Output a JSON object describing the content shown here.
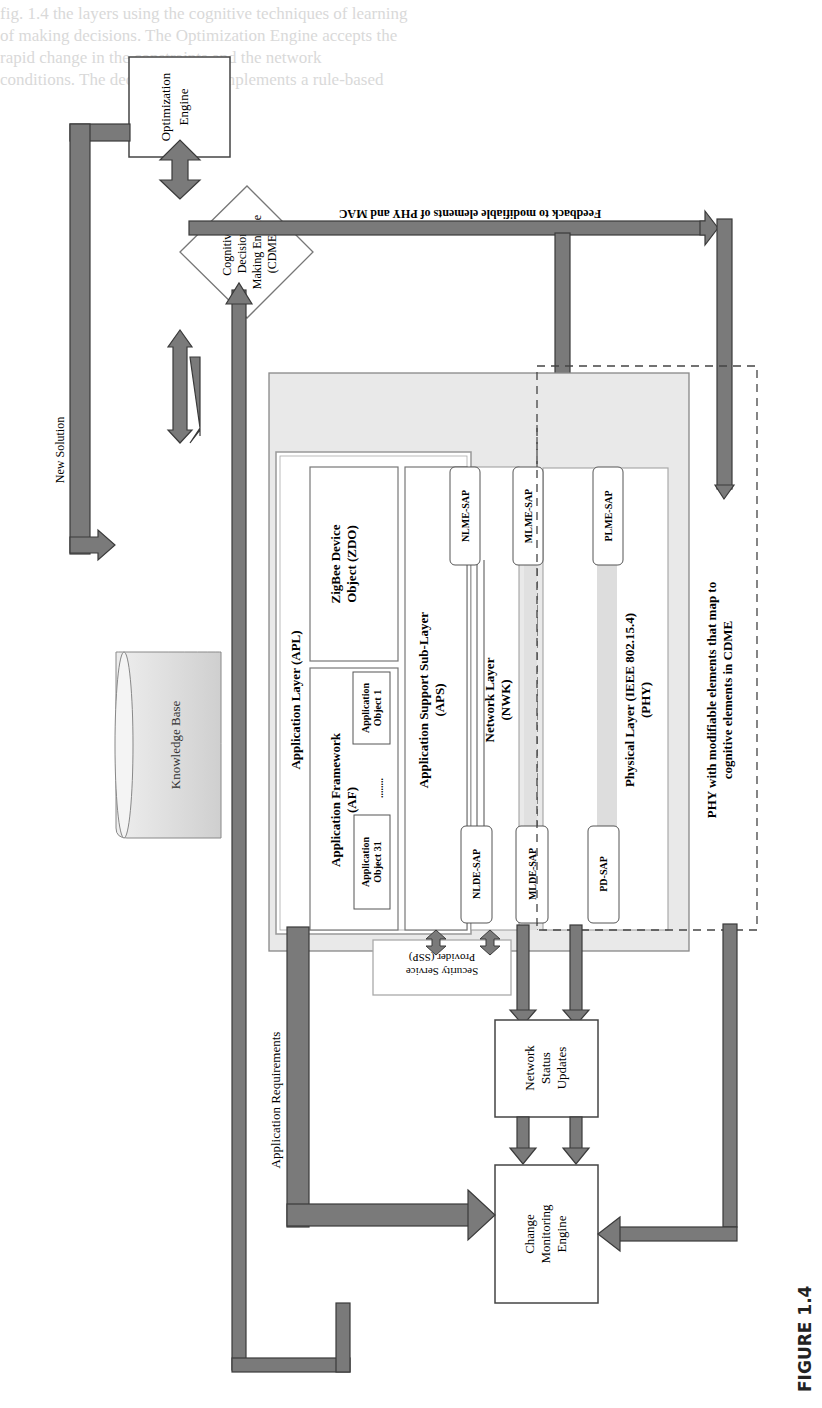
{
  "figure": {
    "caption": "FIGURE 1.4",
    "orientation": "rotated 90° counter-clockwise (landscape figure on portrait page)"
  },
  "colors": {
    "arrow_fill": "#7a7a7a",
    "arrow_stroke": "#3a3a3a",
    "stack_fill": "#e8e8e8",
    "kb_fill": "#d8d8d8",
    "box_border": "#555555",
    "background": "#ffffff"
  },
  "nodes": {
    "optimization_engine": "Optimization Engine",
    "cdme": [
      "Cognitive",
      "Decision",
      "Making Engine",
      "(CDME)"
    ],
    "knowledge_base": "Knowledge Base",
    "network_status_updates": [
      "Network",
      "Status",
      "Updates"
    ],
    "change_monitoring_engine": [
      "Change",
      "Monitoring",
      "Engine"
    ],
    "ssp": [
      "Security Service",
      "Provider (SSP)"
    ],
    "phy_modifiable": [
      "PHY with modifiable elements that map to",
      "cognitive elements in CDME"
    ]
  },
  "stack": {
    "title": [
      "IEEE 802.15.4/ZigBee",
      "Stack"
    ],
    "apl": "Application Layer (APL)",
    "af": [
      "Application Framework",
      "(AF)"
    ],
    "app_object_1": [
      "Application",
      "Object 1"
    ],
    "app_object_31": [
      "Application",
      "Object 31"
    ],
    "ellipsis": "........",
    "zdo": [
      "ZigBee Device",
      "Object (ZDO)"
    ],
    "aps": [
      "Application Support Sub-Layer",
      "(APS)"
    ],
    "nwk": [
      "Network Layer",
      "(NWK)"
    ],
    "mac": [
      "Medium Access Control (IEEE 802.15.4)",
      "Sub-Layer (MAC)"
    ],
    "phy": [
      "Physical Layer (IEEE 802.15.4)",
      "(PHY)"
    ],
    "saps": {
      "nlme": "NLME-SAP",
      "nlde": "NLDE-SAP",
      "mlme": "MLME-SAP",
      "mlde": "MLDE-SAP",
      "plme": "PLME-SAP",
      "pd": "PD-SAP"
    }
  },
  "edges": {
    "new_solution": "New Solution",
    "feedback": "Feedback to modifiable elements of PHY and MAC",
    "application_requirements": "Application Requirements"
  },
  "background_text_lines": [
    "fig. 1.4 the layers using the cognitive techniques of learning",
    "of making decisions. The Optimization Engine accepts the",
    "rapid change in the constraints and the network",
    "conditions. The decision model implements a rule-based",
    "Cognitive Decision Making Engine."
  ]
}
